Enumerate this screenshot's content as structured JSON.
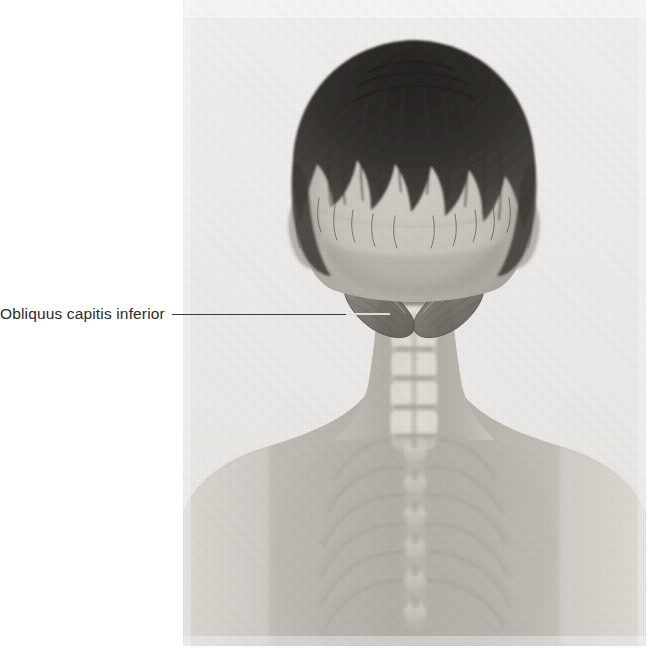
{
  "figure": {
    "kind": "anatomical-photograph-overlay",
    "background_color": "#ffffff",
    "plate": {
      "x": 183,
      "y": 0,
      "width": 463,
      "height": 646,
      "tone": "grayscale halftone print"
    }
  },
  "labels": [
    {
      "id": "obliquus-capitis-inferior",
      "text": "Obliquus capitis inferior",
      "text_color": "#2b2b2b",
      "leader_color": "#3c3c3c",
      "leader_from_x": 179,
      "leader_to_x": 392,
      "leader_y": 313
    }
  ],
  "anatomy": {
    "highlighted_muscle": "Obliquus capitis inferior",
    "highlight_color": "#6e6a63",
    "visible_structures": [
      "scalp and hair",
      "occipital bone",
      "atlas (C1) transverse process",
      "axis (C2) spinous process",
      "cervical vertebrae C3-C7",
      "thoracic vertebrae",
      "ribs",
      "scapula",
      "clavicle",
      "shoulders and upper back skin"
    ]
  },
  "palette": {
    "paper": "#ffffff",
    "plate_base": "#efeeec",
    "skin_light": "#d6d3cd",
    "skin_mid": "#b9b5ae",
    "skin_shadow": "#9a968f",
    "hair_dark": "#272523",
    "hair_mid": "#4a4743",
    "bone_light": "#e6e3dd",
    "bone_mid": "#c7c3bb",
    "muscle": "#77726a",
    "muscle_dark": "#5e5a53",
    "text": "#2b2b2b"
  }
}
